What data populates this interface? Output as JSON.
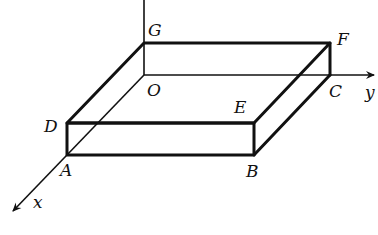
{
  "diagram": {
    "type": "3d-coordinate-box",
    "axes": {
      "x": {
        "label": "x"
      },
      "y": {
        "label": "y"
      }
    },
    "vertices": {
      "O": {
        "label": "O"
      },
      "A": {
        "label": "A"
      },
      "B": {
        "label": "B"
      },
      "C": {
        "label": "C"
      },
      "D": {
        "label": "D"
      },
      "E": {
        "label": "E"
      },
      "F": {
        "label": "F"
      },
      "G": {
        "label": "G"
      }
    },
    "line_color": "#111111",
    "background": "#ffffff"
  }
}
